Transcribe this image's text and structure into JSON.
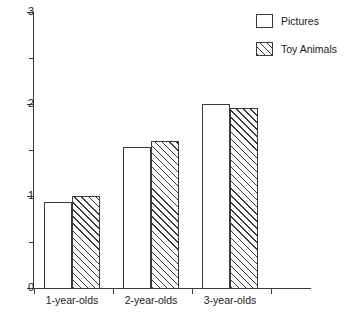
{
  "chart_data": {
    "type": "bar",
    "title": "",
    "subtitle": "",
    "xlabel": "",
    "ylabel": "",
    "categories": [
      "1-year-olds",
      "2-year-olds",
      "3-year-olds"
    ],
    "series": [
      {
        "name": "Pictures",
        "values": [
          0.94,
          1.53,
          2.0
        ],
        "fill": "open",
        "color": "#ffffff"
      },
      {
        "name": "Toy Animals",
        "values": [
          1.0,
          1.6,
          1.96
        ],
        "fill": "diagonal-hatch",
        "color": "#3a3a3a"
      }
    ],
    "ylim": [
      0,
      3
    ],
    "y_ticks_major": [
      "0",
      "1",
      "2",
      "3"
    ],
    "y_ticks_major_values": [
      0,
      1,
      2,
      3
    ],
    "y_ticks_minor_values": [
      0.5,
      1.5,
      2.5
    ],
    "grid": false,
    "legend_position": "top-right",
    "annotations": []
  },
  "legend": {
    "entries": [
      {
        "label": "Pictures",
        "swatch": "open-box"
      },
      {
        "label": "Toy Animals",
        "swatch": "hatched-box"
      }
    ]
  },
  "axis": {
    "y_labels": [
      "3",
      "2",
      "1",
      "0"
    ],
    "x_labels": [
      "1-year-olds",
      "2-year-olds",
      "3-year-olds"
    ]
  },
  "colors": {
    "axis": "#3a3a3a",
    "text": "#1a1a1a",
    "background": "#ffffff",
    "hatch": "#3a3a3a"
  }
}
